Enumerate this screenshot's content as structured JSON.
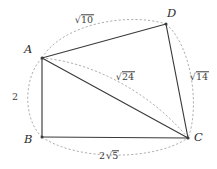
{
  "figure": {
    "kind": "geometry-diagram",
    "ink_color": "#3a3a3a",
    "arc_color": "#9a9a9a",
    "background": "#ffffff",
    "vertices": [
      {
        "id": "A",
        "label": "A",
        "x": 42,
        "y": 58
      },
      {
        "id": "B",
        "label": "B",
        "x": 42,
        "y": 137
      },
      {
        "id": "C",
        "label": "C",
        "x": 188,
        "y": 138
      },
      {
        "id": "D",
        "label": "D",
        "x": 166,
        "y": 24
      }
    ],
    "edges": [
      {
        "id": "AD",
        "from": "A",
        "to": "D",
        "style": "solid"
      },
      {
        "id": "DC",
        "from": "D",
        "to": "C",
        "style": "solid"
      },
      {
        "id": "BC",
        "from": "B",
        "to": "C",
        "style": "solid"
      },
      {
        "id": "AB",
        "from": "A",
        "to": "B",
        "style": "solid"
      },
      {
        "id": "AC",
        "from": "A",
        "to": "C",
        "style": "solid",
        "role": "diagonal"
      }
    ],
    "arcs": [
      {
        "id": "arc-AD",
        "from": "A",
        "to": "D",
        "style": "dashed",
        "bulge": "outward-top"
      },
      {
        "id": "arc-DC",
        "from": "D",
        "to": "C",
        "style": "dashed",
        "bulge": "outward-right"
      },
      {
        "id": "arc-BC",
        "from": "B",
        "to": "C",
        "style": "dashed",
        "bulge": "outward-bottom"
      },
      {
        "id": "arc-AB",
        "from": "A",
        "to": "B",
        "style": "dashed",
        "bulge": "outward-left"
      },
      {
        "id": "arc-AC",
        "from": "A",
        "to": "C",
        "style": "dashed",
        "bulge": "inward"
      }
    ],
    "labels": {
      "AD": {
        "coefficient": "",
        "radicand": "10",
        "text": "√10"
      },
      "DC": {
        "coefficient": "",
        "radicand": "14",
        "text": "√14"
      },
      "BC": {
        "coefficient": "2",
        "radicand": "5",
        "text": "2√5"
      },
      "AB": {
        "coefficient": "2",
        "radicand": "",
        "text": "2"
      },
      "AC": {
        "coefficient": "",
        "radicand": "24",
        "text": "√24"
      }
    }
  }
}
